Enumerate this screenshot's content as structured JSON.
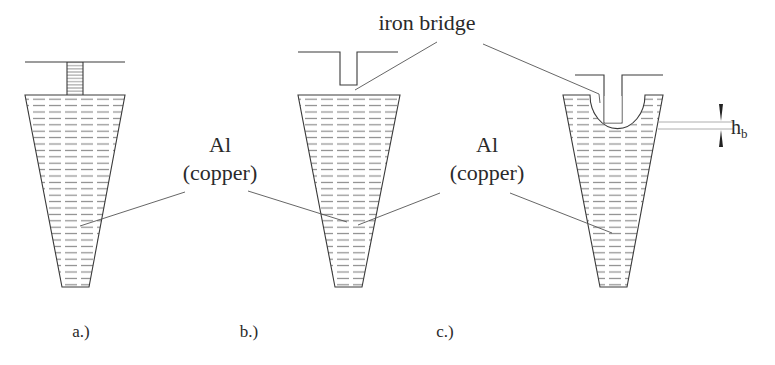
{
  "figure": {
    "title_label": "iron bridge",
    "material_label_line1": "Al",
    "material_label_line2": "(copper)",
    "dimension_label_main": "h",
    "dimension_label_sub": "b",
    "panels": [
      {
        "id": "a",
        "caption": "a.)"
      },
      {
        "id": "b",
        "caption": "b.)"
      },
      {
        "id": "c",
        "caption": "c.)"
      }
    ],
    "labels": {
      "left_material": {
        "line1": "Al",
        "line2": "(copper)"
      },
      "right_material": {
        "line1": "Al",
        "line2": "(copper)"
      },
      "bridge": "iron bridge",
      "height": {
        "main": "h",
        "sub": "b"
      }
    },
    "colors": {
      "line": "#3a3a3a",
      "hatch": "#8a8a8a",
      "background": "#ffffff"
    }
  }
}
